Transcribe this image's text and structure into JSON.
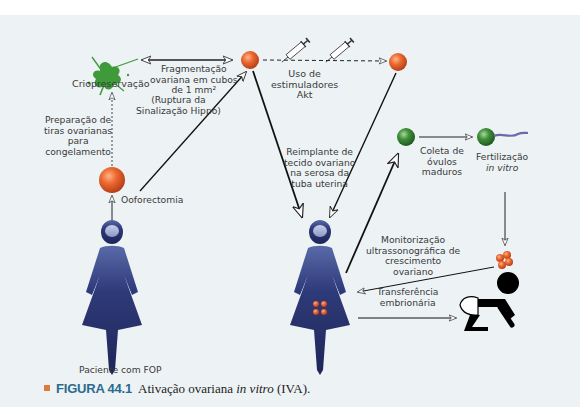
{
  "figure": {
    "background_color": "#edf2f5",
    "labels": {
      "criopreservacao": "Criopreservação",
      "fragmentacao": [
        "Fragmentação",
        "ovariana em cubos",
        "de 1 mm²"
      ],
      "ruptura": [
        "(Ruptura da",
        "Sinalização Hippo)"
      ],
      "uso_estimuladores": [
        "Uso de",
        "estimuladores",
        "Akt"
      ],
      "preparacao": [
        "Preparação de",
        "tiras ovarianas",
        "para",
        "congelamento"
      ],
      "ooforectomia": "Ooforectomia",
      "reimplante": [
        "Reimplante de",
        "tecido ovariano",
        "na serosa da",
        "tuba uterina"
      ],
      "coleta": [
        "Coleta de",
        "óvulos",
        "maduros"
      ],
      "fertilizacao": [
        "Fertilização",
        "in vitro"
      ],
      "monitorizacao": [
        "Monitorização",
        "ultrassonográfica de",
        "crescimento",
        "ovariano"
      ],
      "transferencia": [
        "Transferência",
        "embrionária"
      ],
      "paciente": "Paciente com FOP"
    },
    "colors": {
      "ovary_orange": "#e8602a",
      "oocyte_green": "#3f8f3a",
      "figure_navy": "#2a3570",
      "splat_green": "#3f9b3a",
      "embryo_orange": "#e8742a",
      "arrow": "#111111"
    }
  },
  "caption": {
    "label": "FIGURA 44.1",
    "text_before": "Ativação ovariana ",
    "text_italic": "in vitro",
    "text_after": " (IVA)."
  }
}
